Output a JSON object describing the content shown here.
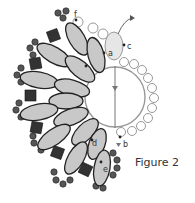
{
  "figure": {
    "caption": "Figure 2",
    "labels": {
      "a": "a",
      "b": "b",
      "c": "c",
      "d": "d",
      "e": "e",
      "f": "f"
    }
  },
  "colors": {
    "long_bead_fill": "#c8c8c8",
    "long_bead_stroke": "#222222",
    "seed_bead_dark": "#555555",
    "cube_bead": "#333333",
    "outline_light": "#999999",
    "thread": "#555555"
  },
  "elements": {
    "center_ring": "large circle with vertical thread path",
    "outer_seed_ring": "small open circles around right side",
    "long_beads": "ring of elongated oval beads",
    "cube_beads": "dark square beads between ovals",
    "seed_clusters": "dark round seed beads on outer edge"
  }
}
